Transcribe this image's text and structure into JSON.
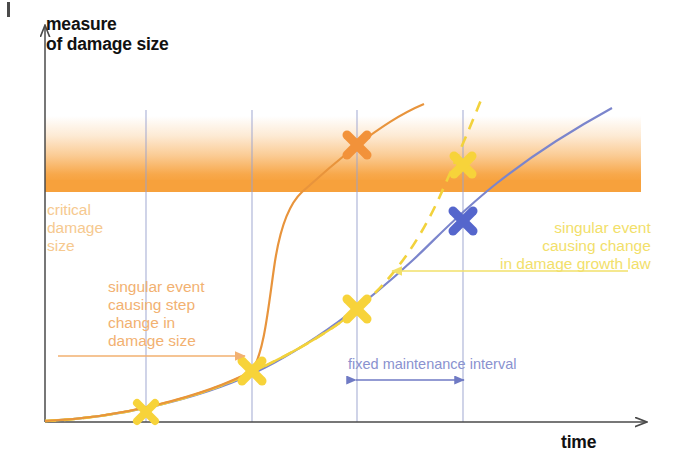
{
  "diagram": {
    "title_y_axis": "measure\nof damage size",
    "title_x_axis": "time",
    "labels": {
      "critical_damage": "critical\ndamage\nsize",
      "step_change": "singular event\ncausing step\nchange in\ndamage size",
      "growth_law": "singular event\ncausing change\nin damage growth law",
      "maintenance_interval": "fixed maintenance interval"
    },
    "colors": {
      "axis": "#4a4a4a",
      "critical_band": "#f7a13c",
      "critical_text": "#f6c98f",
      "step_text": "#f2b171",
      "growth_text": "#f2e06a",
      "blue_curve": "#7b85cc",
      "blue_marker": "#5566cc",
      "yellow_curve": "#f2d23c",
      "yellow_marker": "#f7d33a",
      "orange_curve": "#e8943c",
      "orange_marker": "#f2923a",
      "gridline": "#9aa3d0",
      "interval_text": "#8a92cf"
    },
    "gridlines": [
      146,
      252,
      357,
      463
    ],
    "markers": [
      {
        "name": "marker-g1-yellow",
        "x": 146,
        "y": 412,
        "color": "#f7d33a",
        "size": 13
      },
      {
        "name": "marker-g2-yellow",
        "x": 252,
        "y": 371,
        "color": "#f7d33a",
        "size": 15
      },
      {
        "name": "marker-g3-yellow",
        "x": 357,
        "y": 309,
        "color": "#f7d33a",
        "size": 15
      },
      {
        "name": "marker-g3-orange",
        "x": 357,
        "y": 145,
        "color": "#f2923a",
        "size": 15
      },
      {
        "name": "marker-g4-yellow",
        "x": 463,
        "y": 165,
        "color": "#f7d33a",
        "size": 15
      },
      {
        "name": "marker-g4-blue",
        "x": 463,
        "y": 221,
        "color": "#5566cc",
        "size": 15
      }
    ],
    "band": {
      "top": 116,
      "solid_top": 180,
      "bottom": 192,
      "left": 45,
      "right": 641
    },
    "axes": {
      "origin_x": 45,
      "origin_y": 422,
      "top_y": 24,
      "right_x": 648
    }
  }
}
